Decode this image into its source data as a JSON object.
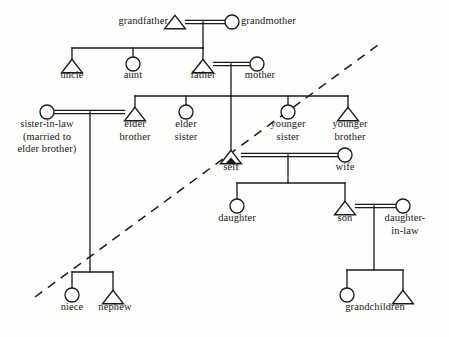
{
  "figure": {
    "kind": "kinship-diagram",
    "title": "",
    "background_color": "#fdfdfb",
    "line_color": "#1a1a1a",
    "text_color": "#1a1a1a",
    "ego_marker": "filled-triangle"
  },
  "legend": {
    "male_symbol": "triangle",
    "female_symbol": "circle",
    "marriage_line": "double-horizontal-line",
    "descent_line": "single-line",
    "divider_line": "dashed-diagonal"
  },
  "chart_data": {
    "type": "diagram",
    "title": "",
    "nodes": [
      {
        "id": "grandfather",
        "label": "grandfather",
        "sex": "male",
        "x": 175,
        "y": 22,
        "label_x": 168,
        "label_y": 15,
        "anchor": "right"
      },
      {
        "id": "grandmother",
        "label": "grandmother",
        "sex": "female",
        "x": 232,
        "y": 22,
        "label_x": 241,
        "label_y": 15,
        "anchor": "left"
      },
      {
        "id": "uncle",
        "label": "uncle",
        "sex": "male",
        "x": 72,
        "y": 66,
        "label_x": 72,
        "label_y": 69,
        "anchor": "center"
      },
      {
        "id": "aunt",
        "label": "aunt",
        "sex": "female",
        "x": 133,
        "y": 64,
        "label_x": 133,
        "label_y": 69,
        "anchor": "center"
      },
      {
        "id": "father",
        "label": "father",
        "sex": "male",
        "x": 203,
        "y": 66,
        "label_x": 203,
        "label_y": 69,
        "anchor": "center"
      },
      {
        "id": "mother",
        "label": "mother",
        "sex": "female",
        "x": 257,
        "y": 64,
        "label_x": 260,
        "label_y": 69,
        "anchor": "center"
      },
      {
        "id": "sister-in-law",
        "label": "sister-in-law\n(married to\nelder brother)",
        "sex": "female",
        "x": 47,
        "y": 112,
        "label_x": 47,
        "label_y": 118,
        "anchor": "center"
      },
      {
        "id": "elder-brother",
        "label": "elder\nbrother",
        "sex": "male",
        "x": 135,
        "y": 114,
        "label_x": 135,
        "label_y": 118,
        "anchor": "center"
      },
      {
        "id": "elder-sister",
        "label": "elder\nsister",
        "sex": "female",
        "x": 186,
        "y": 112,
        "label_x": 186,
        "label_y": 118,
        "anchor": "center"
      },
      {
        "id": "younger-sister",
        "label": "younger\nsister",
        "sex": "female",
        "x": 288,
        "y": 112,
        "label_x": 288,
        "label_y": 118,
        "anchor": "center"
      },
      {
        "id": "younger-brother",
        "label": "younger\nbrother",
        "sex": "male",
        "x": 348,
        "y": 114,
        "label_x": 350,
        "label_y": 118,
        "anchor": "center"
      },
      {
        "id": "self",
        "label": "self",
        "sex": "male",
        "x": 231,
        "y": 157,
        "label_x": 231,
        "label_y": 161,
        "anchor": "center",
        "is_ego": true
      },
      {
        "id": "wife",
        "label": "wife",
        "sex": "female",
        "x": 345,
        "y": 155,
        "label_x": 345,
        "label_y": 161,
        "anchor": "center"
      },
      {
        "id": "daughter",
        "label": "daughter",
        "sex": "female",
        "x": 237,
        "y": 206,
        "label_x": 237,
        "label_y": 212,
        "anchor": "center"
      },
      {
        "id": "son",
        "label": "son",
        "sex": "male",
        "x": 345,
        "y": 208,
        "label_x": 345,
        "label_y": 212,
        "anchor": "center"
      },
      {
        "id": "daughter-in-law",
        "label": "daughter-\nin-law",
        "sex": "female",
        "x": 403,
        "y": 206,
        "label_x": 405,
        "label_y": 212,
        "anchor": "center"
      },
      {
        "id": "niece",
        "label": "niece",
        "sex": "female",
        "x": 72,
        "y": 295,
        "label_x": 72,
        "label_y": 301,
        "anchor": "center"
      },
      {
        "id": "nephew",
        "label": "nephew",
        "sex": "male",
        "x": 113,
        "y": 297,
        "label_x": 115,
        "label_y": 301,
        "anchor": "center"
      },
      {
        "id": "grandchild-f",
        "label": "grandchildren",
        "sex": "female",
        "x": 347,
        "y": 295,
        "label_x": 375,
        "label_y": 301,
        "anchor": "center"
      },
      {
        "id": "grandchild-m",
        "label": "",
        "sex": "male",
        "x": 403,
        "y": 297,
        "label_x": 0,
        "label_y": 0,
        "anchor": "center"
      }
    ],
    "marriages": [
      {
        "spouse_a": "grandfather",
        "spouse_b": "grandmother",
        "y": 22,
        "descent_x": 203
      },
      {
        "spouse_a": "father",
        "spouse_b": "mother",
        "y": 64,
        "descent_x": 231
      },
      {
        "spouse_a": "sister-in-law",
        "spouse_b": "elder-brother",
        "y": 112,
        "descent_x": 90
      },
      {
        "spouse_a": "self",
        "spouse_b": "wife",
        "y": 155,
        "descent_x": 288
      },
      {
        "spouse_a": "son",
        "spouse_b": "daughter-in-law",
        "y": 206,
        "descent_x": 374
      }
    ],
    "sibling_groups": [
      {
        "parents": "grandfather+grandmother",
        "bar_y": 48,
        "children": [
          "uncle",
          "aunt",
          "father"
        ]
      },
      {
        "parents": "father+mother",
        "bar_y": 96,
        "children": [
          "elder-brother",
          "elder-sister",
          "self",
          "younger-sister",
          "younger-brother"
        ]
      },
      {
        "parents": "sister-in-law+elder-brother",
        "bar_y": 272,
        "children": [
          "niece",
          "nephew"
        ]
      },
      {
        "parents": "self+wife",
        "bar_y": 183,
        "children": [
          "daughter",
          "son"
        ]
      },
      {
        "parents": "son+daughter-in-law",
        "bar_y": 270,
        "children": [
          "grandchild-f",
          "grandchild-m"
        ]
      }
    ],
    "divider": {
      "x1": 35,
      "y1": 297,
      "x2": 378,
      "y2": 45,
      "style": "dashed"
    }
  }
}
